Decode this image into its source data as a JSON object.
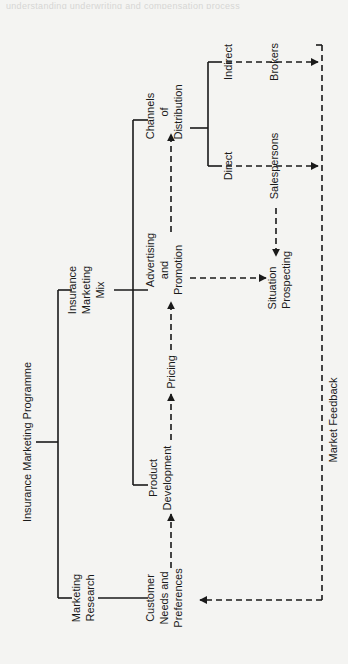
{
  "page": {
    "background": "#f4f4f2",
    "ink_color": "#1a1a1a",
    "bleed_through_text": "understanding underwriting and compensation process"
  },
  "diagram": {
    "orientation": "rotated 90° counter-clockwise",
    "root": {
      "label": "Insurance Marketing Programme"
    },
    "branches": {
      "marketing_research": {
        "lines": [
          "Marketing",
          "Research"
        ]
      },
      "marketing_mix": {
        "lines": [
          "Insurance",
          "Marketing",
          "Mix"
        ]
      }
    },
    "mix_elements": {
      "customer_needs": {
        "lines": [
          "Customer",
          "Needs and",
          "Preferences"
        ]
      },
      "product_development": {
        "lines": [
          "Product",
          "Development"
        ]
      },
      "pricing": {
        "label": "Pricing"
      },
      "advertising": {
        "lines": [
          "Advertising",
          "and",
          "Promotion"
        ]
      },
      "channels": {
        "lines": [
          "Channels",
          "of",
          "Distribution"
        ]
      }
    },
    "distribution": {
      "direct": {
        "label": "Direct"
      },
      "indirect": {
        "label": "Indirect"
      },
      "salespersons": {
        "label": "Salespersons"
      },
      "brokers": {
        "label": "Brokers"
      }
    },
    "situation": {
      "lines": [
        "Situation",
        "Prospecting"
      ]
    },
    "feedback": {
      "label": "Market Feedback"
    }
  }
}
